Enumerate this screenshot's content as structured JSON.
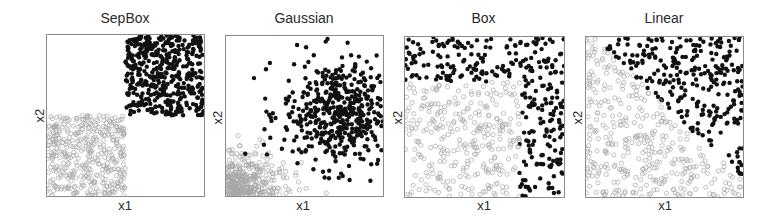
{
  "chart_data": [
    {
      "type": "scatter",
      "title": "SepBox",
      "xlabel": "x1",
      "ylabel": "x2",
      "grid": false,
      "legend": null,
      "series": [
        {
          "name": "class-positive",
          "marker": "filled-dot",
          "color": "#111111",
          "region": {
            "x": [
              0.5,
              1.0
            ],
            "y": [
              0.5,
              1.0
            ]
          },
          "distribution": "uniform"
        },
        {
          "name": "class-negative",
          "marker": "open-circle",
          "color": "#a0a0a0",
          "region": {
            "x": [
              0.0,
              0.5
            ],
            "y": [
              0.0,
              0.5
            ]
          },
          "distribution": "uniform"
        }
      ]
    },
    {
      "type": "scatter",
      "title": "Gaussian",
      "xlabel": "x1",
      "ylabel": "x2",
      "grid": false,
      "legend": null,
      "series": [
        {
          "name": "class-positive",
          "marker": "filled-dot",
          "color": "#111111",
          "center": [
            0.7,
            0.55
          ],
          "spread": [
            0.18,
            0.18
          ],
          "distribution": "gaussian"
        },
        {
          "name": "class-negative",
          "marker": "open-circle",
          "color": "#a0a0a0",
          "center": [
            0.1,
            0.1
          ],
          "spread": [
            0.15,
            0.12
          ],
          "distribution": "gaussian"
        }
      ]
    },
    {
      "type": "scatter",
      "title": "Box",
      "xlabel": "x1",
      "ylabel": "x2",
      "grid": false,
      "legend": null,
      "series": [
        {
          "name": "class-positive",
          "marker": "filled-dot",
          "color": "#111111",
          "rule": "x1 > 0.7 or x2 > 0.7",
          "distribution": "uniform"
        },
        {
          "name": "class-negative",
          "marker": "open-circle",
          "color": "#a0a0a0",
          "rule": "x1 <= 0.7 and x2 <= 0.7",
          "distribution": "uniform"
        }
      ]
    },
    {
      "type": "scatter",
      "title": "Linear",
      "xlabel": "x1",
      "ylabel": "x2",
      "grid": false,
      "legend": null,
      "series": [
        {
          "name": "class-positive",
          "marker": "filled-dot",
          "color": "#111111",
          "rule": "x2 > 1.0 - x1 * 0.9 (upper-right of diagonal)",
          "distribution": "uniform"
        },
        {
          "name": "class-negative",
          "marker": "open-circle",
          "color": "#a0a0a0",
          "rule": "below diagonal",
          "distribution": "uniform"
        }
      ]
    }
  ],
  "panels": [
    {
      "title": "SepBox",
      "xlabel": "x1",
      "ylabel": "x2"
    },
    {
      "title": "Gaussian",
      "xlabel": "x1",
      "ylabel": "x2"
    },
    {
      "title": "Box",
      "xlabel": "x1",
      "ylabel": "x2"
    },
    {
      "title": "Linear",
      "xlabel": "x1",
      "ylabel": "x2"
    }
  ],
  "colors": {
    "positive": "#111111",
    "negative": "#a8a8a8",
    "axis": "#8a8a8a"
  }
}
